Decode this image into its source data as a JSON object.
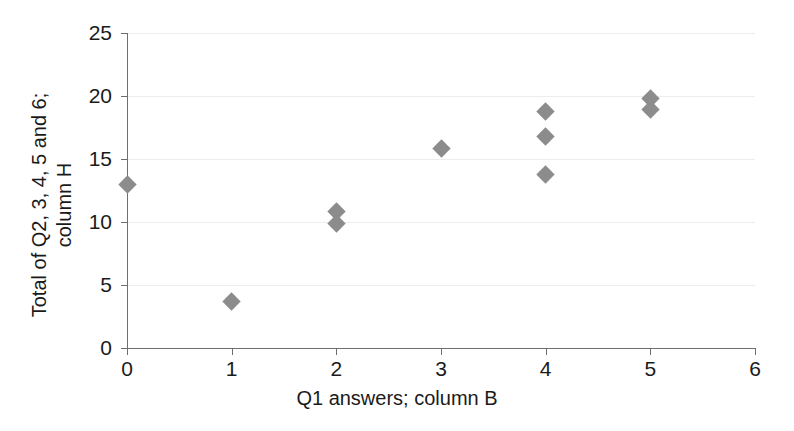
{
  "chart_data": {
    "type": "scatter",
    "title": "",
    "xlabel": "Q1 answers; column B",
    "ylabel_line1": "Total of Q2, 3, 4, 5 and 6;",
    "ylabel_line2": "column H",
    "ylabel": "Total of Q2, 3, 4, 5 and 6; column H",
    "xlim": [
      0,
      6
    ],
    "ylim": [
      0,
      25
    ],
    "xticks": [
      0,
      1,
      2,
      3,
      4,
      5,
      6
    ],
    "xtick_labels": [
      "0",
      "1",
      "2",
      "3",
      "4",
      "5",
      "6"
    ],
    "yticks": [
      0,
      5,
      10,
      15,
      20,
      25
    ],
    "ytick_labels": [
      "0",
      "5",
      "10",
      "15",
      "20",
      "25"
    ],
    "grid": "horizontal",
    "grid_color": "#ededed",
    "axis_color": "#6e6e6e",
    "marker": "diamond",
    "marker_color": "#8c8c8c",
    "marker_size": 13,
    "legend": null,
    "series": [
      {
        "name": "Q1 vs total",
        "points": [
          {
            "x": 0,
            "y": 13.0
          },
          {
            "x": 1,
            "y": 3.7
          },
          {
            "x": 2,
            "y": 10.8
          },
          {
            "x": 2,
            "y": 9.9
          },
          {
            "x": 3,
            "y": 15.8
          },
          {
            "x": 4,
            "y": 18.8
          },
          {
            "x": 4,
            "y": 16.8
          },
          {
            "x": 4,
            "y": 13.8
          },
          {
            "x": 5,
            "y": 19.8
          },
          {
            "x": 5,
            "y": 18.9
          }
        ]
      }
    ]
  }
}
